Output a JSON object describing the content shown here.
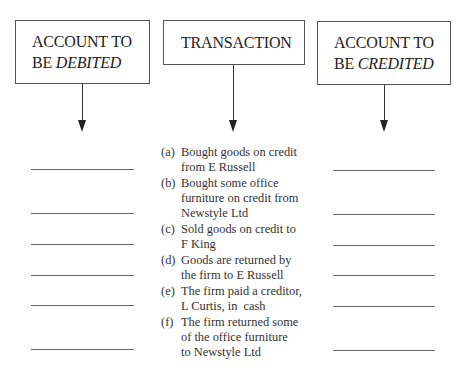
{
  "boxes": {
    "debited": {
      "line1": "ACCOUNT TO",
      "line2_prefix": "BE ",
      "line2_italic": "DEBITED"
    },
    "transaction": {
      "label": "TRANSACTION"
    },
    "credited": {
      "line1": "ACCOUNT TO",
      "line2_prefix": "BE ",
      "line2_italic": "CREDITED"
    }
  },
  "transactions": [
    {
      "label": "(a)",
      "lines": [
        "Bought goods on credit",
        "from E Russell"
      ]
    },
    {
      "label": "(b)",
      "lines": [
        "Bought some office",
        "furniture on credit from",
        "Newstyle Ltd"
      ]
    },
    {
      "label": "(c)",
      "lines": [
        "Sold goods on credit to",
        "F King"
      ]
    },
    {
      "label": "(d)",
      "lines": [
        "Goods are returned by",
        "the firm to E Russell"
      ]
    },
    {
      "label": "(e)",
      "lines": [
        "The firm paid a creditor,",
        "L Curtis, in  cash"
      ]
    },
    {
      "label": "(f)",
      "lines": [
        "The firm returned some",
        "of the office furniture",
        "to Newstyle Ltd"
      ]
    }
  ],
  "answer_blanks": {
    "debit": [
      "",
      "",
      "",
      "",
      "",
      ""
    ],
    "credit": [
      "",
      "",
      "",
      "",
      "",
      ""
    ]
  }
}
